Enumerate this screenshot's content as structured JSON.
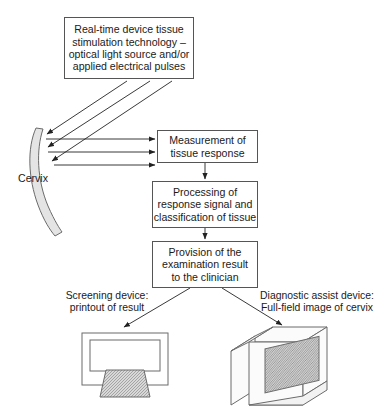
{
  "diagram": {
    "title_fragment": "",
    "nodes": [
      {
        "id": "stimulation",
        "label": "Real-time device tissue\nstimulation technology –\noptical light source and/or\napplied electrical pulses"
      },
      {
        "id": "measurement",
        "label": "Measurement of\ntissue response"
      },
      {
        "id": "processing",
        "label": "Processing of\nresponse signal and\nclassification of tissue"
      },
      {
        "id": "provision",
        "label": "Provision of the\nexamination result\nto the clinician"
      }
    ],
    "labels": {
      "cervix": "Cervix",
      "screening_device": "Screening device:\nprintout of result",
      "diagnostic_device": "Diagnostic assist device:\nFull-field image of cervix"
    },
    "shapes": {
      "cervix_shape": "curved-crescent",
      "screening_device_shape": "printer-with-printout",
      "diagnostic_device_shape": "isometric-monitor-with-screen"
    },
    "arrows": {
      "stimulation_to_cervix_count": 3,
      "cervix_to_measurement_count": 3,
      "measurement_to_processing_count": 1,
      "processing_to_provision_count": 1,
      "provision_to_screening_count": 1,
      "provision_to_diagnostic_count": 1
    },
    "colors": {
      "stroke": "#555555",
      "text": "#1a1a1a",
      "background": "#ffffff",
      "shape_fill": "#e4e4e4",
      "screen_fill": "#c9c9c9"
    }
  }
}
